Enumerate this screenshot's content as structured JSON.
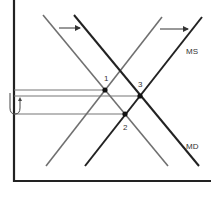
{
  "diagram": {
    "type": "money market supply-demand shift",
    "curves": [
      {
        "name": "MD (initial)",
        "color": "#707070",
        "x1": 43,
        "y1": 15,
        "x2": 168,
        "y2": 166
      },
      {
        "name": "MD (shifted)",
        "color": "#222222",
        "x1": 74,
        "y1": 15,
        "x2": 199,
        "y2": 166
      },
      {
        "name": "MS (initial)",
        "color": "#707070",
        "x1": 46,
        "y1": 166,
        "x2": 162,
        "y2": 17
      },
      {
        "name": "MS (shifted)",
        "color": "#222222",
        "x1": 85,
        "y1": 166,
        "x2": 202,
        "y2": 17
      }
    ],
    "labels": {
      "ms": "MS",
      "md": "MD",
      "point1": "1",
      "point2": "2",
      "point3": "3"
    },
    "points": [
      {
        "label": "1",
        "x": 105,
        "y": 90
      },
      {
        "label": "3",
        "x": 140,
        "y": 96
      },
      {
        "label": "2",
        "x": 125,
        "y": 114
      }
    ],
    "arrows": [
      {
        "desc": "demand shift right",
        "x1": 59,
        "y1": 28,
        "x2": 80,
        "y2": 28
      },
      {
        "desc": "supply shift right",
        "x1": 160,
        "y1": 29,
        "x2": 188,
        "y2": 29
      }
    ]
  }
}
